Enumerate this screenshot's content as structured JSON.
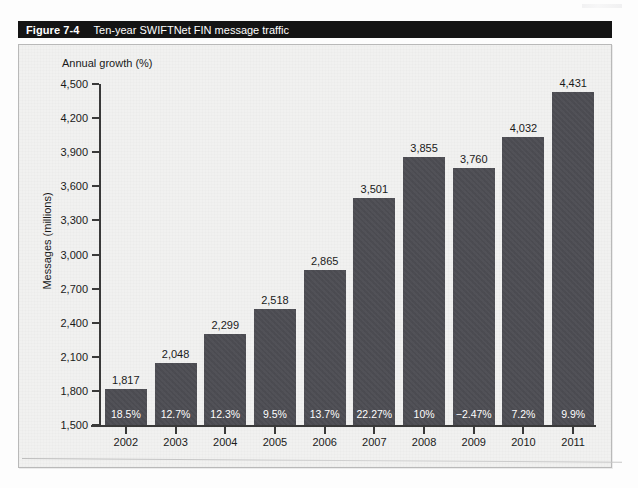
{
  "figure": {
    "number": "Figure 7-4",
    "caption": "Ten-year SWIFTNet FIN message traffic"
  },
  "chart_data": {
    "type": "bar",
    "title": "Ten-year SWIFTNet FIN message traffic",
    "xlabel": "",
    "ylabel": "Messages (millions)",
    "secondary_label": "Annual growth (%)",
    "ylim": [
      1500,
      4500
    ],
    "yticks": [
      "1,500",
      "1,800",
      "2,100",
      "2,400",
      "2,700",
      "3,000",
      "3,300",
      "3,600",
      "3,900",
      "4,200",
      "4,500"
    ],
    "ytick_values": [
      1500,
      1800,
      2100,
      2400,
      2700,
      3000,
      3300,
      3600,
      3900,
      4200,
      4500
    ],
    "grid": false,
    "legend": "none",
    "categories": [
      "2002",
      "2003",
      "2004",
      "2005",
      "2006",
      "2007",
      "2008",
      "2009",
      "2010",
      "2011"
    ],
    "values": [
      1817,
      2048,
      2299,
      2518,
      2865,
      3501,
      3855,
      3760,
      4032,
      4431
    ],
    "value_labels": [
      "1,817",
      "2,048",
      "2,299",
      "2,518",
      "2,865",
      "3,501",
      "3,855",
      "3,760",
      "4,032",
      "4,431"
    ],
    "growth_labels": [
      "18.5%",
      "12.7%",
      "12.3%",
      "9.5%",
      "13.7%",
      "22.27%",
      "10%",
      "−2.47%",
      "7.2%",
      "9.9%"
    ],
    "growth_values": [
      18.5,
      12.7,
      12.3,
      9.5,
      13.7,
      22.27,
      10,
      -2.47,
      7.2,
      9.9
    ],
    "colors": {
      "bar": "#4c4c52",
      "plot_background": "#f1f1f0",
      "axis": "#3a3a3a",
      "caption_bar": "#141414",
      "caption_text": "#ffffff"
    }
  }
}
